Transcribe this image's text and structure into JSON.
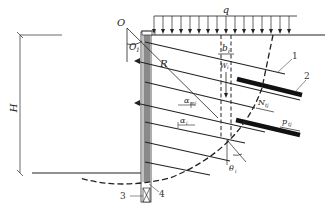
{
  "diagram": {
    "title": "",
    "type": "soil-nail wall circular slip surface stability analysis",
    "labels": {
      "O": "O",
      "O1": "O",
      "O1_sub": "1",
      "q": "q",
      "R": "R",
      "H": "H",
      "b": "b",
      "b_sub": "i",
      "W": "W",
      "W_sub": "i",
      "N": "N",
      "N_sub": "tj",
      "p": "p",
      "p_sub": "tj",
      "alpha_m": "α",
      "alpha_m_sub": "mj",
      "alpha_i": "α",
      "alpha_i_sub": "i",
      "theta": "θ",
      "theta_sub": "i"
    },
    "callouts": [
      {
        "id": "1",
        "text": "1"
      },
      {
        "id": "2",
        "text": "2"
      },
      {
        "id": "3",
        "text": "3"
      },
      {
        "id": "4",
        "text": "4"
      }
    ],
    "colors": {
      "line": "#222222",
      "wall_fill": "#8a8a8a",
      "background": "#ffffff"
    }
  }
}
